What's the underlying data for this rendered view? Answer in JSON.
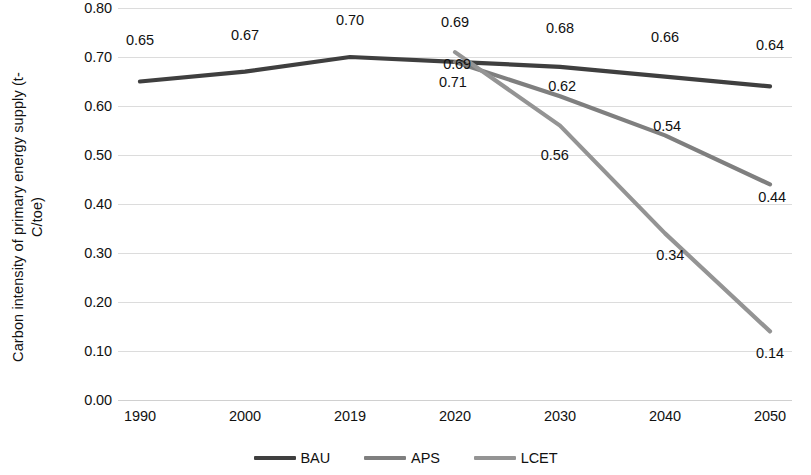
{
  "chart_data": {
    "type": "line",
    "title": "",
    "xlabel": "",
    "ylabel": "Carbon intensity of primary energy supply (t-\nC/toe)",
    "categories": [
      "1990",
      "2000",
      "2019",
      "2020",
      "2030",
      "2040",
      "2050"
    ],
    "ylim": [
      0.0,
      0.8
    ],
    "ytick_labels": [
      "0.80",
      "0.70",
      "0.60",
      "0.50",
      "0.40",
      "0.30",
      "0.20",
      "0.10",
      "0.00"
    ],
    "ytick_values": [
      0.8,
      0.7,
      0.6,
      0.5,
      0.4,
      0.3,
      0.2,
      0.1,
      0.0
    ],
    "grid": true,
    "legend_position": "bottom",
    "series": [
      {
        "name": "BAU",
        "color": "#3f3f3f",
        "values": [
          0.65,
          0.67,
          0.7,
          0.69,
          0.68,
          0.66,
          0.64
        ],
        "labels": [
          "0.65",
          "0.67",
          "0.70",
          "0.69",
          "0.68",
          "0.66",
          "0.64"
        ]
      },
      {
        "name": "APS",
        "color": "#7f7f7f",
        "values": [
          null,
          null,
          null,
          0.69,
          0.62,
          0.54,
          0.44
        ],
        "labels": [
          null,
          null,
          null,
          "0.69",
          "0.62",
          "0.54",
          "0.44"
        ]
      },
      {
        "name": "LCET",
        "color": "#949494",
        "values": [
          null,
          null,
          null,
          0.71,
          0.56,
          0.34,
          0.14
        ],
        "labels": [
          null,
          null,
          null,
          "0.71",
          "0.56",
          "0.34",
          "0.14"
        ]
      }
    ],
    "annotations": [
      {
        "text": "0.65",
        "x": 0,
        "y": 0.735,
        "series": "BAU"
      },
      {
        "text": "0.67",
        "x": 1,
        "y": 0.745,
        "series": "BAU"
      },
      {
        "text": "0.70",
        "x": 2,
        "y": 0.775,
        "series": "BAU"
      },
      {
        "text": "0.69",
        "x": 3,
        "y": 0.772,
        "series": "BAU"
      },
      {
        "text": "0.69",
        "x": 3.02,
        "y": 0.685,
        "series": "APS"
      },
      {
        "text": "0.71",
        "x": 2.98,
        "y": 0.648,
        "series": "LCET"
      },
      {
        "text": "0.68",
        "x": 4,
        "y": 0.76,
        "series": "BAU"
      },
      {
        "text": "0.62",
        "x": 4.02,
        "y": 0.64,
        "series": "APS"
      },
      {
        "text": "0.56",
        "x": 3.95,
        "y": 0.5,
        "series": "LCET"
      },
      {
        "text": "0.66",
        "x": 5,
        "y": 0.74,
        "series": "BAU"
      },
      {
        "text": "0.54",
        "x": 5.02,
        "y": 0.56,
        "series": "APS"
      },
      {
        "text": "0.34",
        "x": 5.05,
        "y": 0.295,
        "series": "LCET"
      },
      {
        "text": "0.64",
        "x": 6,
        "y": 0.725,
        "series": "BAU"
      },
      {
        "text": "0.44",
        "x": 6.02,
        "y": 0.415,
        "series": "APS"
      },
      {
        "text": "0.14",
        "x": 6.0,
        "y": 0.095,
        "series": "LCET"
      }
    ]
  },
  "legend": {
    "items": [
      {
        "label": "BAU",
        "color": "#3f3f3f"
      },
      {
        "label": "APS",
        "color": "#7f7f7f"
      },
      {
        "label": "LCET",
        "color": "#949494"
      }
    ]
  }
}
